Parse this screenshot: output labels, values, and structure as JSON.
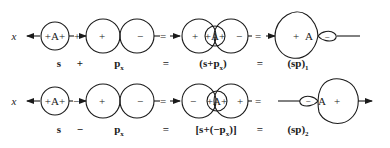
{
  "axis_label": "x",
  "row1": {
    "s_orbital": "+A+",
    "p_plus": "+",
    "p_minus": "−",
    "nucleus": "A",
    "combo_left": "+",
    "combo_center": "+A+",
    "combo_right": "−",
    "hybrid_plus": "+",
    "hybrid_nucleus": "A",
    "hybrid_minus": "−",
    "op1": "+",
    "op2": "=",
    "op3": "=",
    "labels": {
      "s": "s",
      "op1": "+",
      "p": "p",
      "p_sub": "x",
      "eq1": "=",
      "combo": "(s+p",
      "combo_sub": "x",
      "combo_close": ")",
      "eq2": "=",
      "hybrid": "(sp)",
      "hybrid_sub": "1"
    }
  },
  "row2": {
    "s_orbital": "+A+",
    "p_plus": "+",
    "p_minus": "−",
    "nucleus": "A",
    "combo_left": "−",
    "combo_center": "+A+",
    "combo_right": "+",
    "hybrid_minus": "−",
    "hybrid_nucleus": "A",
    "hybrid_plus": "+",
    "op1": "−",
    "op2": "=",
    "op3": "=",
    "labels": {
      "s": "s",
      "op1": "−",
      "p": "p",
      "p_sub": "x",
      "eq1": "=",
      "combo": "[s+(−p",
      "combo_sub": "x",
      "combo_close": ")]",
      "eq2": "=",
      "hybrid": "(sp)",
      "hybrid_sub": "2"
    }
  },
  "colors": {
    "ink": "#1a1a1a",
    "background": "#ffffff"
  }
}
